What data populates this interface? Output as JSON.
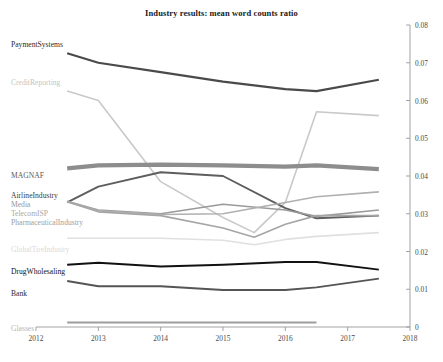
{
  "chart_data": {
    "type": "line",
    "title": "Industry results: mean word counts ratio",
    "xlabel": "",
    "ylabel": "",
    "xlim": [
      2012,
      2018
    ],
    "ylim": [
      0,
      0.08
    ],
    "grid": false,
    "legend_position": "inline-left-labels",
    "y_axis_side": "right",
    "x_ticks": [
      "2012",
      "2013",
      "2014",
      "2015",
      "2016",
      "2017",
      "2018"
    ],
    "x_tick_values": [
      2012,
      2013,
      2014,
      2015,
      2016,
      2017,
      2018
    ],
    "y_ticks": [
      "0",
      "0.01",
      "0.02",
      "0.03",
      "0.04",
      "0.05",
      "0.06",
      "0.07",
      "0.08"
    ],
    "y_tick_values": [
      0,
      0.01,
      0.02,
      0.03,
      0.04,
      0.05,
      0.06,
      0.07,
      0.08
    ],
    "x": [
      2012.0,
      2012.5,
      2013.0,
      2014.0,
      2015.0,
      2015.5,
      2016.0,
      2016.5,
      2017.0,
      2017.5
    ],
    "series": [
      {
        "name": "PaymentSystems",
        "color": "#4a4a4a",
        "width": 2.2,
        "label_x": 11,
        "label_y": 41,
        "label_color": "#2b2b2b",
        "x": [
          2012.5,
          2013.0,
          2014.0,
          2015.0,
          2016.0,
          2016.5,
          2017.5
        ],
        "values": [
          0.0725,
          0.07,
          0.0675,
          0.065,
          0.063,
          0.0625,
          0.0655
        ]
      },
      {
        "name": "CreditReporting",
        "color": "#c9c9c9",
        "width": 1.6,
        "label_x": 11,
        "label_y": 79,
        "label_color": "#c4c4c4",
        "x": [
          2012.5,
          2013.0,
          2014.0,
          2015.0,
          2015.5,
          2016.0,
          2016.5,
          2017.5
        ],
        "values": [
          0.0625,
          0.06,
          0.0385,
          0.029,
          0.025,
          0.033,
          0.057,
          0.056
        ]
      },
      {
        "name": "MAGNAF",
        "color": "#8d8d8d",
        "width": 4.2,
        "label_x": 11,
        "label_y": 172,
        "label_color": "#5a5a5a",
        "x": [
          2012.5,
          2013.0,
          2014.0,
          2015.0,
          2016.0,
          2016.5,
          2017.5
        ],
        "values": [
          0.042,
          0.0428,
          0.043,
          0.0428,
          0.0425,
          0.0428,
          0.0418
        ]
      },
      {
        "name": "AirlineIndustry",
        "color": "#5e5e5e",
        "width": 1.9,
        "label_x": 11,
        "label_y": 192,
        "label_color": "#3d3d3d",
        "x": [
          2012.5,
          2013.0,
          2014.0,
          2015.0,
          2016.0,
          2016.5,
          2017.5
        ],
        "values": [
          0.033,
          0.0372,
          0.041,
          0.04,
          0.0315,
          0.0288,
          0.0295
        ]
      },
      {
        "name": "Media",
        "color": "#9a9a9a",
        "width": 1.6,
        "label_x": 11,
        "label_y": 201,
        "label_color": "#979797",
        "x": [
          2012.5,
          2013.0,
          2014.0,
          2015.0,
          2016.0,
          2016.5,
          2017.5
        ],
        "values": [
          0.0333,
          0.031,
          0.03,
          0.0325,
          0.031,
          0.0293,
          0.031
        ]
      },
      {
        "name": "TelecomISP",
        "color": "#b0b0b0",
        "width": 1.6,
        "label_x": 11,
        "label_y": 210,
        "label_color": "#a8a8a8",
        "x": [
          2012.5,
          2013.0,
          2014.0,
          2015.0,
          2016.0,
          2016.5,
          2017.5
        ],
        "values": [
          0.0332,
          0.0308,
          0.0298,
          0.03,
          0.033,
          0.0345,
          0.0358
        ]
      },
      {
        "name": "PharmaceuticalIndustry",
        "color": "#a5a5a5",
        "width": 1.6,
        "label_x": 11,
        "label_y": 219,
        "label_color": "#9e9e9e",
        "x": [
          2012.5,
          2013.0,
          2014.0,
          2015.0,
          2015.5,
          2016.0,
          2016.5,
          2017.5
        ],
        "values": [
          0.0332,
          0.0305,
          0.0295,
          0.0262,
          0.0238,
          0.0272,
          0.0295,
          0.0295
        ]
      },
      {
        "name": "GlobalTireIndustry",
        "color": "#e0e0e0",
        "width": 1.6,
        "label_x": 11,
        "label_y": 246,
        "label_color": "#dadada",
        "x": [
          2012.5,
          2013.0,
          2014.0,
          2015.0,
          2015.5,
          2016.0,
          2016.5,
          2017.5
        ],
        "values": [
          0.0235,
          0.0235,
          0.0235,
          0.023,
          0.0218,
          0.0232,
          0.024,
          0.025
        ]
      },
      {
        "name": "DrugWholesaling",
        "color": "#111111",
        "width": 2.0,
        "label_x": 11,
        "label_y": 268,
        "label_color": "#111111",
        "x": [
          2012.5,
          2013.0,
          2014.0,
          2015.0,
          2016.0,
          2016.5,
          2017.5
        ],
        "values": [
          0.0165,
          0.017,
          0.016,
          0.0165,
          0.0172,
          0.0172,
          0.0152
        ]
      },
      {
        "name": "Bank",
        "color": "#555555",
        "width": 1.9,
        "label_x": 11,
        "label_y": 290,
        "label_color": "#2b2b2b",
        "x": [
          2012.5,
          2013.0,
          2014.0,
          2015.0,
          2016.0,
          2016.5,
          2017.5
        ],
        "values": [
          0.0122,
          0.0108,
          0.0108,
          0.0098,
          0.0098,
          0.0105,
          0.0128
        ]
      },
      {
        "name": "Glasses",
        "color": "#9d9d9d",
        "width": 2.0,
        "label_x": 11,
        "label_y": 325,
        "label_color": "#b4b4b4",
        "x": [
          2012.5,
          2013.0,
          2014.0,
          2015.0,
          2016.0,
          2016.5
        ],
        "values": [
          0.0012,
          0.0012,
          0.0012,
          0.0012,
          0.0012,
          0.0012
        ]
      }
    ]
  },
  "axis": {
    "axis_color": "#999999",
    "tick_color": "#999999",
    "label_color": "#4a4a4a"
  }
}
